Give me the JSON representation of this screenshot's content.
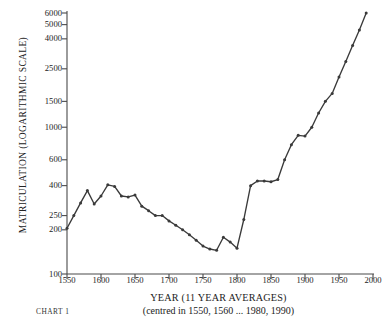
{
  "chart_data": {
    "type": "line",
    "title": "",
    "xlabel": "YEAR (11 YEAR AVERAGES)",
    "xlabel_sub": "(centred in 1550, 1560 ... 1980, 1990)",
    "ylabel": "MATRICULATION (LOGARITHMIC SCALE)",
    "chart_number": "CHART 1",
    "scale": "log",
    "grid": false,
    "legend": null,
    "xlim": [
      1545,
      1995
    ],
    "ylim": [
      100,
      6000
    ],
    "yticks": [
      100,
      200,
      250,
      400,
      600,
      1000,
      1500,
      2500,
      4000,
      5000,
      6000
    ],
    "ytick_labels": [
      "100",
      "200",
      "250",
      "400",
      "600",
      "1000",
      "1500",
      "2500",
      "4000",
      "5000",
      "6000"
    ],
    "xticks": [
      1550,
      1600,
      1650,
      1700,
      1750,
      1800,
      1850,
      1900,
      1950,
      2000
    ],
    "xtick_labels": [
      "1550",
      "1600",
      "1650",
      "1700",
      "1750",
      "1800",
      "1850",
      "1900",
      "1950",
      "2000"
    ],
    "series": [
      {
        "name": "Matriculations",
        "marker": "dot",
        "color": "#3a3a3a",
        "x": [
          1550,
          1560,
          1570,
          1580,
          1590,
          1600,
          1610,
          1620,
          1630,
          1640,
          1650,
          1660,
          1670,
          1680,
          1690,
          1700,
          1710,
          1720,
          1730,
          1740,
          1750,
          1760,
          1770,
          1780,
          1790,
          1800,
          1810,
          1820,
          1830,
          1840,
          1850,
          1860,
          1870,
          1880,
          1890,
          1900,
          1910,
          1920,
          1930,
          1940,
          1950,
          1960,
          1970,
          1980,
          1990
        ],
        "y": [
          205,
          250,
          300,
          360,
          380,
          330,
          290,
          400,
          430,
          380,
          330,
          310,
          295,
          300,
          290,
          255,
          230,
          225,
          195,
          175,
          160,
          150,
          140,
          135,
          170,
          160,
          145,
          230,
          400,
          430,
          425,
          425,
          425,
          480,
          600,
          760,
          950,
          1020,
          1000,
          1200,
          1500,
          1800,
          2200,
          2700,
          3200
        ]
      }
    ],
    "note": "final point continues to 6000 at 1990"
  },
  "plot": {
    "curve_points": [
      {
        "year": 1550,
        "value": 205
      },
      {
        "year": 1560,
        "value": 250
      },
      {
        "year": 1570,
        "value": 305
      },
      {
        "year": 1580,
        "value": 370
      },
      {
        "year": 1590,
        "value": 300
      },
      {
        "year": 1600,
        "value": 340
      },
      {
        "year": 1610,
        "value": 405
      },
      {
        "year": 1620,
        "value": 395
      },
      {
        "year": 1630,
        "value": 340
      },
      {
        "year": 1640,
        "value": 335
      },
      {
        "year": 1650,
        "value": 345
      },
      {
        "year": 1660,
        "value": 290
      },
      {
        "year": 1670,
        "value": 270
      },
      {
        "year": 1680,
        "value": 250
      },
      {
        "year": 1690,
        "value": 250
      },
      {
        "year": 1700,
        "value": 230
      },
      {
        "year": 1710,
        "value": 215
      },
      {
        "year": 1720,
        "value": 200
      },
      {
        "year": 1730,
        "value": 185
      },
      {
        "year": 1740,
        "value": 170
      },
      {
        "year": 1750,
        "value": 155
      },
      {
        "year": 1760,
        "value": 148
      },
      {
        "year": 1770,
        "value": 145
      },
      {
        "year": 1780,
        "value": 178
      },
      {
        "year": 1790,
        "value": 165
      },
      {
        "year": 1800,
        "value": 150
      },
      {
        "year": 1810,
        "value": 235
      },
      {
        "year": 1820,
        "value": 400
      },
      {
        "year": 1830,
        "value": 430
      },
      {
        "year": 1840,
        "value": 430
      },
      {
        "year": 1850,
        "value": 425
      },
      {
        "year": 1860,
        "value": 440
      },
      {
        "year": 1870,
        "value": 600
      },
      {
        "year": 1880,
        "value": 760
      },
      {
        "year": 1890,
        "value": 880
      },
      {
        "year": 1900,
        "value": 870
      },
      {
        "year": 1910,
        "value": 1000
      },
      {
        "year": 1920,
        "value": 1250
      },
      {
        "year": 1930,
        "value": 1500
      },
      {
        "year": 1940,
        "value": 1700
      },
      {
        "year": 1950,
        "value": 2200
      },
      {
        "year": 1960,
        "value": 2800
      },
      {
        "year": 1970,
        "value": 3600
      },
      {
        "year": 1980,
        "value": 4600
      },
      {
        "year": 1990,
        "value": 6000
      }
    ]
  }
}
